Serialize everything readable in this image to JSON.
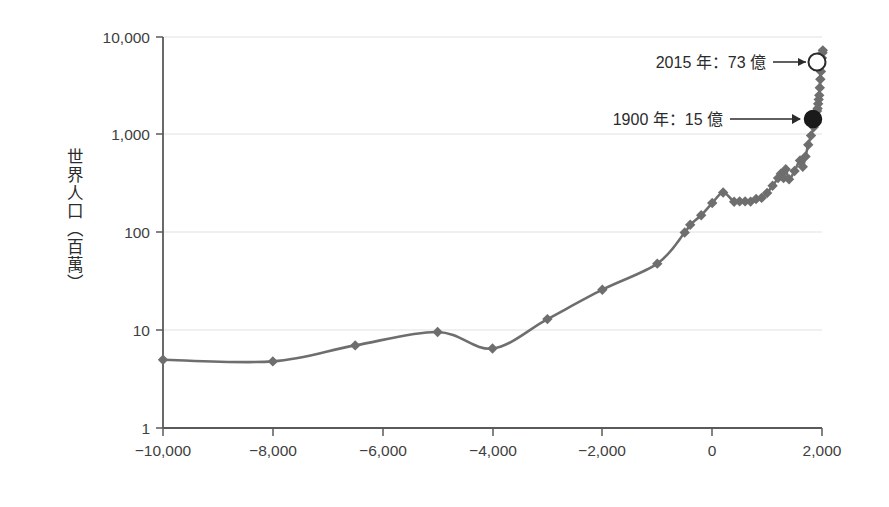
{
  "chart_data": {
    "type": "line",
    "title": "",
    "subtitle": "",
    "xlabel": "",
    "ylabel": "世界人口（百萬）",
    "yscale": "log",
    "ylim": [
      1,
      10000
    ],
    "xlim": [
      -10000,
      2000
    ],
    "grid": true,
    "legend": null,
    "y_ticks": [
      {
        "value": 10000,
        "label": "10,000"
      },
      {
        "value": 1000,
        "label": "1,000"
      },
      {
        "value": 100,
        "label": "100"
      },
      {
        "value": 10,
        "label": "10"
      },
      {
        "value": 1,
        "label": "1"
      }
    ],
    "x_ticks": [
      {
        "value": -10000,
        "label": "−10,000"
      },
      {
        "value": -8000,
        "label": "−8,000"
      },
      {
        "value": -6000,
        "label": "−6,000"
      },
      {
        "value": -4000,
        "label": "−4,000"
      },
      {
        "value": -2000,
        "label": "−2,000"
      },
      {
        "value": 0,
        "label": "0"
      },
      {
        "value": 2000,
        "label": "2,000"
      }
    ],
    "series": [
      {
        "name": "世界人口",
        "color": "#6e6e6e",
        "marker": "diamond",
        "x": [
          -10000,
          -8000,
          -6500,
          -5000,
          -4000,
          -3000,
          -2000,
          -1000,
          -500,
          -400,
          -200,
          1,
          200,
          400,
          500,
          600,
          700,
          800,
          900,
          1000,
          1100,
          1200,
          1250,
          1300,
          1340,
          1400,
          1500,
          1600,
          1650,
          1700,
          1750,
          1800,
          1850,
          1900,
          1910,
          1920,
          1930,
          1940,
          1950,
          1960,
          1970,
          1980,
          1990,
          2000,
          2010,
          2015
        ],
        "y": [
          5,
          4.8,
          7,
          9.6,
          6.5,
          13,
          26,
          48,
          100,
          120,
          150,
          200,
          257,
          206,
          208,
          208,
          207,
          220,
          226,
          254,
          301,
          360,
          400,
          360,
          443,
          350,
          425,
          545,
          470,
          600,
          790,
          980,
          1200,
          1500,
          1750,
          1860,
          2070,
          2300,
          2530,
          3030,
          3700,
          4440,
          5280,
          6100,
          6900,
          7300
        ]
      }
    ],
    "annotations": [
      {
        "name": "annotation-2015",
        "text": "2015 年：73 億",
        "arrow": "→",
        "x": 2015,
        "y": 7300,
        "marker": "open-circle",
        "marker_fill": "#ffffff",
        "marker_stroke": "#2b2b2b"
      },
      {
        "name": "annotation-1900",
        "text": "1900 年：15 億",
        "arrow": "→",
        "x": 1900,
        "y": 1500,
        "marker": "filled-circle",
        "marker_fill": "#1a1a1a",
        "marker_stroke": "#1a1a1a"
      }
    ],
    "colors": {
      "line": "#6e6e6e",
      "marker": "#6e6e6e",
      "axis": "#5a5a5a",
      "grid": "#e2e2e2",
      "text": "#2b2b2b",
      "background": "#ffffff",
      "highlight_open": "#ffffff",
      "highlight_filled": "#1a1a1a"
    }
  },
  "labels": {
    "y_title": "世界人口（百萬）",
    "y_10000": "10,000",
    "y_1000": "1,000",
    "y_100": "100",
    "y_10": "10",
    "y_1": "1",
    "x_m10000": "−10,000",
    "x_m8000": "−8,000",
    "x_m6000": "−6,000",
    "x_m4000": "−4,000",
    "x_m2000": "−2,000",
    "x_0": "0",
    "x_2000": "2,000",
    "annotation_2015": "2015 年：73 億",
    "annotation_1900": "1900 年：15 億"
  }
}
